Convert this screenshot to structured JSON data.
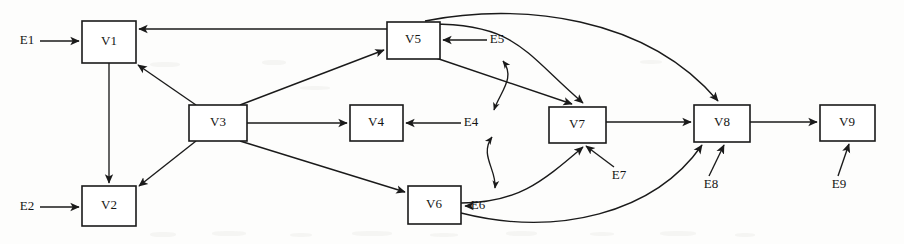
{
  "figure": {
    "kind": "directed-graph-diagram",
    "width": 904,
    "height": 244,
    "background_color": "#fdfdfc",
    "line_color": "#1a1a1a",
    "node_fill": "#ffffff"
  },
  "nodes": [
    {
      "id": "V1",
      "label": "V1",
      "x": 82,
      "y": 21,
      "w": 54,
      "h": 42
    },
    {
      "id": "V2",
      "label": "V2",
      "x": 82,
      "y": 186,
      "w": 54,
      "h": 40
    },
    {
      "id": "V3",
      "label": "V3",
      "x": 189,
      "y": 105,
      "w": 58,
      "h": 36
    },
    {
      "id": "V4",
      "label": "V4",
      "x": 350,
      "y": 105,
      "w": 53,
      "h": 36
    },
    {
      "id": "V5",
      "label": "V5",
      "x": 387,
      "y": 22,
      "w": 53,
      "h": 37
    },
    {
      "id": "V6",
      "label": "V6",
      "x": 408,
      "y": 186,
      "w": 53,
      "h": 38
    },
    {
      "id": "V7",
      "label": "V7",
      "x": 549,
      "y": 107,
      "w": 57,
      "h": 36
    },
    {
      "id": "V8",
      "label": "V8",
      "x": 694,
      "y": 105,
      "w": 56,
      "h": 37
    },
    {
      "id": "V9",
      "label": "V9",
      "x": 820,
      "y": 105,
      "w": 55,
      "h": 36
    }
  ],
  "external_inputs": [
    {
      "id": "E1",
      "label": "E1",
      "x": 27,
      "y": 41,
      "target": "V1"
    },
    {
      "id": "E2",
      "label": "E2",
      "x": 27,
      "y": 207,
      "target": "V2"
    },
    {
      "id": "E4",
      "label": "E4",
      "x": 471,
      "y": 123,
      "target": "V4"
    },
    {
      "id": "E5",
      "label": "E5",
      "x": 497,
      "y": 40,
      "target": "V5"
    },
    {
      "id": "E6",
      "label": "E6",
      "x": 478,
      "y": 206,
      "target": "V6"
    },
    {
      "id": "E7",
      "label": "E7",
      "x": 619,
      "y": 176,
      "target": "V7"
    },
    {
      "id": "E8",
      "label": "E8",
      "x": 711,
      "y": 185,
      "target": "V8"
    },
    {
      "id": "E9",
      "label": "E9",
      "x": 839,
      "y": 185,
      "target": "V9"
    }
  ],
  "edges": [
    {
      "from": "E1",
      "to": "V1",
      "style": "straight"
    },
    {
      "from": "E2",
      "to": "V2",
      "style": "straight"
    },
    {
      "from": "V1",
      "to": "V2",
      "style": "straight"
    },
    {
      "from": "V3",
      "to": "V1",
      "style": "straight"
    },
    {
      "from": "V3",
      "to": "V2",
      "style": "straight"
    },
    {
      "from": "V3",
      "to": "V4",
      "style": "straight"
    },
    {
      "from": "V3",
      "to": "V5",
      "style": "straight"
    },
    {
      "from": "V3",
      "to": "V6",
      "style": "straight"
    },
    {
      "from": "V5",
      "to": "V1",
      "style": "straight"
    },
    {
      "from": "E5",
      "to": "V5",
      "style": "straight"
    },
    {
      "from": "E4",
      "to": "V4",
      "style": "straight"
    },
    {
      "from": "E6",
      "to": "V6",
      "style": "straight"
    },
    {
      "from": "E7",
      "to": "V7",
      "style": "straight"
    },
    {
      "from": "E8",
      "to": "V8",
      "style": "straight"
    },
    {
      "from": "E9",
      "to": "V9",
      "style": "straight"
    },
    {
      "from": "V5",
      "to": "V7",
      "style": "straight-diagonal"
    },
    {
      "from": "V5",
      "to": "V7",
      "style": "curve"
    },
    {
      "from": "V5",
      "to": "V8",
      "style": "long-curve-top"
    },
    {
      "from": "V6",
      "to": "V7",
      "style": "curve"
    },
    {
      "from": "V6",
      "to": "V8",
      "style": "long-curve-bottom"
    },
    {
      "from": "V7",
      "to": "V8",
      "style": "straight"
    },
    {
      "from": "V8",
      "to": "V9",
      "style": "straight"
    }
  ],
  "bidirectional_links": [
    {
      "between": [
        "E5",
        "E4"
      ],
      "style": "curved-double-arrow"
    },
    {
      "between": [
        "E4",
        "E6"
      ],
      "style": "curved-double-arrow"
    }
  ]
}
